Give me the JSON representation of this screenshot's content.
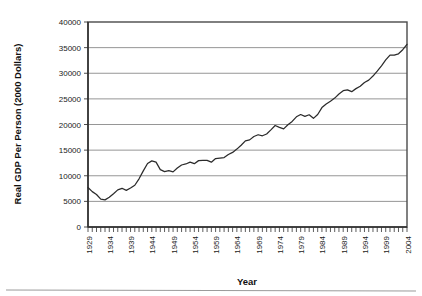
{
  "chart_data": {
    "type": "line",
    "title": "",
    "xlabel": "Year",
    "ylabel": "Real GDP Per Person (2000 Dollars)",
    "xlim": [
      1929,
      2004
    ],
    "ylim": [
      0,
      40000
    ],
    "grid": true,
    "legend": null,
    "ytick_labels": [
      "0",
      "5000",
      "10000",
      "15000",
      "20000",
      "25000",
      "30000",
      "35000",
      "40000"
    ],
    "ytick_values": [
      0,
      5000,
      10000,
      15000,
      20000,
      25000,
      30000,
      35000,
      40000
    ],
    "xtick_labels": [
      "1929",
      "1934",
      "1939",
      "1944",
      "1949",
      "1954",
      "1959",
      "1964",
      "1969",
      "1974",
      "1979",
      "1984",
      "1989",
      "1994",
      "1999",
      "2004"
    ],
    "xtick_values": [
      1929,
      1934,
      1939,
      1944,
      1949,
      1954,
      1959,
      1964,
      1969,
      1974,
      1979,
      1984,
      1989,
      1994,
      1999,
      2004
    ],
    "x": [
      1929,
      1930,
      1931,
      1932,
      1933,
      1934,
      1935,
      1936,
      1937,
      1938,
      1939,
      1940,
      1941,
      1942,
      1943,
      1944,
      1945,
      1946,
      1947,
      1948,
      1949,
      1950,
      1951,
      1952,
      1953,
      1954,
      1955,
      1956,
      1957,
      1958,
      1959,
      1960,
      1961,
      1962,
      1963,
      1964,
      1965,
      1966,
      1967,
      1968,
      1969,
      1970,
      1971,
      1972,
      1973,
      1974,
      1975,
      1976,
      1977,
      1978,
      1979,
      1980,
      1981,
      1982,
      1983,
      1984,
      1985,
      1986,
      1987,
      1988,
      1989,
      1990,
      1991,
      1992,
      1993,
      1994,
      1995,
      1996,
      1997,
      1998,
      1999,
      2000,
      2001,
      2002,
      2003,
      2004
    ],
    "values": [
      7700,
      6900,
      6350,
      5450,
      5300,
      5800,
      6500,
      7250,
      7550,
      7150,
      7600,
      8150,
      9400,
      10950,
      12400,
      12900,
      12650,
      11200,
      10800,
      11000,
      10750,
      11500,
      12100,
      12300,
      12650,
      12350,
      12950,
      13000,
      13000,
      12650,
      13350,
      13450,
      13550,
      14150,
      14550,
      15200,
      15950,
      16800,
      17000,
      17650,
      18000,
      17800,
      18150,
      18950,
      19800,
      19450,
      19150,
      19950,
      20600,
      21500,
      21950,
      21600,
      21900,
      21200,
      21950,
      23300,
      24000,
      24550,
      25150,
      25950,
      26600,
      26750,
      26400,
      27000,
      27450,
      28200,
      28650,
      29450,
      30400,
      31450,
      32600,
      33550,
      33550,
      33800,
      34600,
      35650
    ]
  },
  "page": {
    "has_bottom_rule": true
  }
}
